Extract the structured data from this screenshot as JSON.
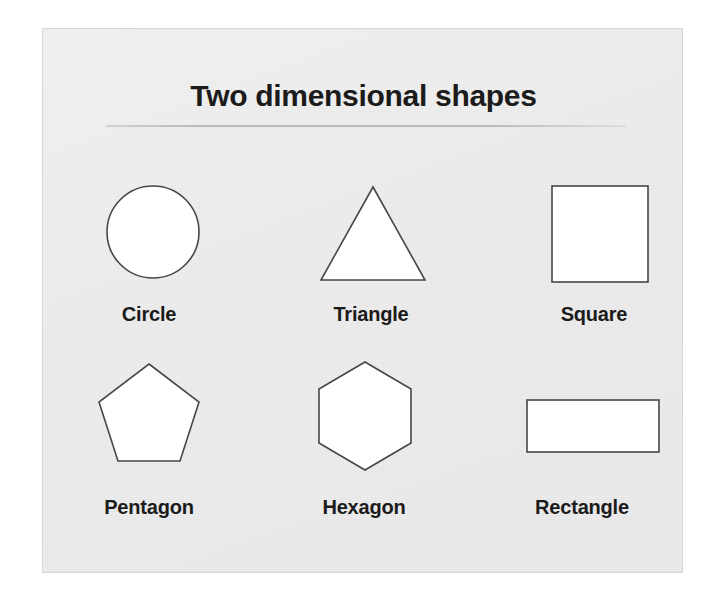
{
  "slide": {
    "title": "Two dimensional shapes",
    "background_color": "#efefef",
    "border_color": "#d8d8d8",
    "title_color": "#1b1b1b",
    "rule_color": "#bcbcbc"
  },
  "shapes": [
    {
      "name": "circle",
      "label": "Circle",
      "sides": 0,
      "fill": "#ffffff",
      "stroke": "#474747"
    },
    {
      "name": "triangle",
      "label": "Triangle",
      "sides": 3,
      "fill": "#ffffff",
      "stroke": "#474747"
    },
    {
      "name": "square",
      "label": "Square",
      "sides": 4,
      "fill": "#ffffff",
      "stroke": "#474747"
    },
    {
      "name": "pentagon",
      "label": "Pentagon",
      "sides": 5,
      "fill": "#ffffff",
      "stroke": "#474747"
    },
    {
      "name": "hexagon",
      "label": "Hexagon",
      "sides": 6,
      "fill": "#ffffff",
      "stroke": "#474747"
    },
    {
      "name": "rectangle",
      "label": "Rectangle",
      "sides": 4,
      "fill": "#ffffff",
      "stroke": "#474747"
    }
  ]
}
